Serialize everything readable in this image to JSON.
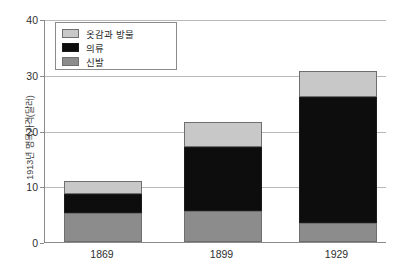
{
  "chart_data": {
    "type": "bar",
    "stacked": true,
    "title": "",
    "xlabel": "",
    "ylabel": "1913년 명목가격(달러)",
    "categories": [
      "1869",
      "1899",
      "1929"
    ],
    "ylim": [
      0,
      40
    ],
    "yticks": [
      0,
      10,
      20,
      30,
      40
    ],
    "ytick_labels": [
      "0",
      "10",
      "20",
      "30",
      "40"
    ],
    "grid": true,
    "legend_position": "upper-left",
    "series": [
      {
        "name": "신발",
        "color": "#8c8c8c",
        "values": [
          5.2,
          5.5,
          3.4
        ]
      },
      {
        "name": "의류",
        "color": "#0d0d0d",
        "values": [
          3.5,
          11.5,
          22.6
        ]
      },
      {
        "name": "옷감과 방물",
        "color": "#c8c8c8",
        "values": [
          2.2,
          4.5,
          4.6
        ]
      }
    ],
    "totals": [
      10.9,
      21.5,
      30.6
    ]
  },
  "legend": {
    "items": [
      {
        "label": "옷감과 방물",
        "color": "#c8c8c8"
      },
      {
        "label": "의류",
        "color": "#0d0d0d"
      },
      {
        "label": "신발",
        "color": "#8c8c8c"
      }
    ]
  }
}
